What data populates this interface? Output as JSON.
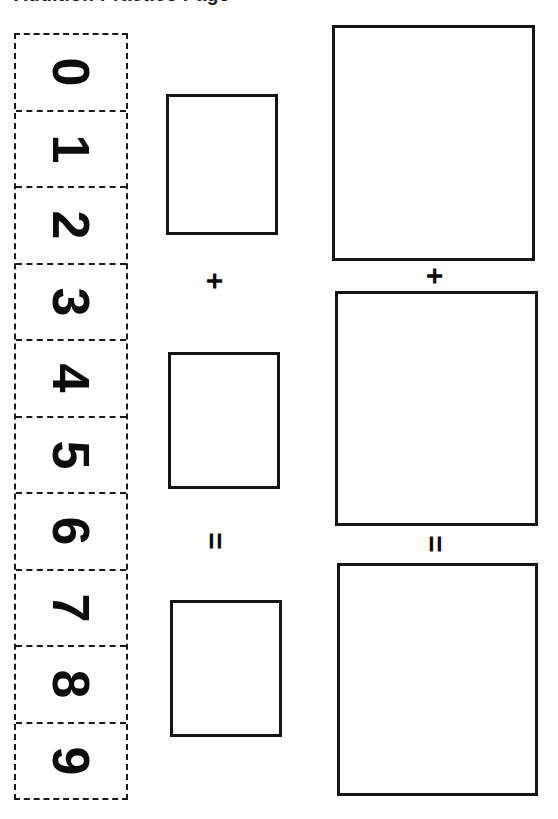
{
  "page": {
    "background_color": "#ffffff",
    "ink_color": "#111111",
    "width": 558,
    "height": 819,
    "orientation_note": "rotated-90-landscape-worksheet"
  },
  "title": {
    "text": "Addition Practice Page",
    "clipped": true
  },
  "digit_strip": {
    "label": "number-line-strip",
    "border_style": "dashed",
    "border_color": "#1a1a1a",
    "digits": [
      {
        "value": "0"
      },
      {
        "value": "1"
      },
      {
        "value": "2"
      },
      {
        "value": "3"
      },
      {
        "value": "4"
      },
      {
        "value": "5"
      },
      {
        "value": "6"
      },
      {
        "value": "7"
      },
      {
        "value": "8"
      },
      {
        "value": "9"
      }
    ]
  },
  "middle_column": {
    "label": "small-answer-column",
    "boxes": [
      {
        "name": "addend-box-1",
        "value": ""
      },
      {
        "name": "addend-box-2",
        "value": ""
      },
      {
        "name": "sum-box",
        "value": ""
      }
    ],
    "operators": [
      {
        "name": "plus",
        "symbol": "+"
      },
      {
        "name": "equals",
        "symbol": "="
      }
    ]
  },
  "right_column": {
    "label": "large-answer-column",
    "boxes": [
      {
        "name": "addend-box-1",
        "value": ""
      },
      {
        "name": "addend-box-2",
        "value": ""
      },
      {
        "name": "sum-box",
        "value": ""
      }
    ],
    "operators": [
      {
        "name": "plus",
        "symbol": "+"
      },
      {
        "name": "equals",
        "symbol": "="
      }
    ]
  }
}
